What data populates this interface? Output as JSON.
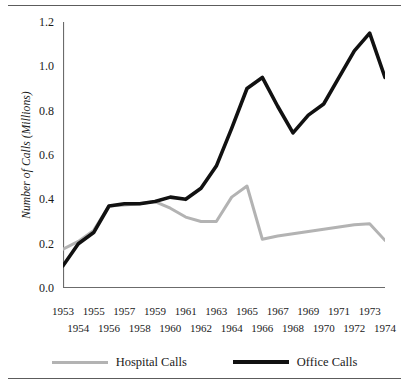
{
  "chart_data": {
    "type": "line",
    "title": "",
    "subtitle": "",
    "xlabel": "",
    "ylabel": "Number of Calls (Millions)",
    "x": [
      1953,
      1954,
      1955,
      1956,
      1957,
      1958,
      1959,
      1960,
      1961,
      1962,
      1963,
      1964,
      1965,
      1966,
      1967,
      1968,
      1969,
      1970,
      1971,
      1972,
      1973,
      1974
    ],
    "xtick_labels_row_top": [
      "1953",
      "1955",
      "1957",
      "1959",
      "1961",
      "1963",
      "1965",
      "1967",
      "1969",
      "1971",
      "1973"
    ],
    "xtick_labels_row_bottom": [
      "1954",
      "1956",
      "1958",
      "1960",
      "1962",
      "1964",
      "1966",
      "1968",
      "1970",
      "1972",
      "1974"
    ],
    "ytick_labels": [
      "1.2",
      "1.0",
      "0.8",
      "0.6",
      "0.4",
      "0.2",
      "0.0"
    ],
    "ytick_values": [
      1.2,
      1.0,
      0.8,
      0.6,
      0.4,
      0.2,
      0.0
    ],
    "xlim": [
      1953,
      1974
    ],
    "ylim": [
      0.0,
      1.2
    ],
    "grid": false,
    "legend_position": "bottom-center",
    "series": [
      {
        "name": "Hospital Calls",
        "color": "#b3b3b3",
        "linewidth": 3,
        "values": [
          0.175,
          0.21,
          0.26,
          0.37,
          0.375,
          0.38,
          0.39,
          0.36,
          0.32,
          0.3,
          0.3,
          0.41,
          0.46,
          0.22,
          0.235,
          0.245,
          0.255,
          0.265,
          0.275,
          0.285,
          0.29,
          0.215
        ]
      },
      {
        "name": "Office Calls",
        "color": "#111111",
        "linewidth": 3.6,
        "values": [
          0.1,
          0.2,
          0.25,
          0.37,
          0.38,
          0.38,
          0.39,
          0.41,
          0.4,
          0.45,
          0.55,
          0.72,
          0.9,
          0.95,
          0.82,
          0.7,
          0.78,
          0.83,
          0.95,
          1.07,
          1.15,
          0.95
        ]
      }
    ]
  },
  "legend": {
    "items": [
      {
        "label": "Hospital Calls",
        "color": "#b3b3b3"
      },
      {
        "label": "Office Calls",
        "color": "#111111"
      }
    ]
  },
  "colors": {
    "hospital": "#b3b3b3",
    "office": "#111111",
    "axis": "#6b6b6b",
    "rule": "#5c5c5c",
    "text": "#1a1a1a",
    "background": "#ffffff"
  }
}
